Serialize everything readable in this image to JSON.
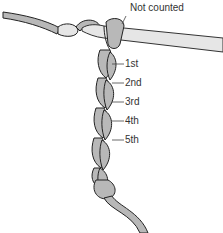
{
  "diagram": {
    "title_label": "Not counted",
    "stitch_labels": [
      "1st",
      "2nd",
      "3rd",
      "4th",
      "5th"
    ],
    "colors": {
      "yarn_fill": "#b8b8b8",
      "yarn_outline": "#222222",
      "hook_fill": "#e6e6e6",
      "text": "#333333"
    }
  }
}
